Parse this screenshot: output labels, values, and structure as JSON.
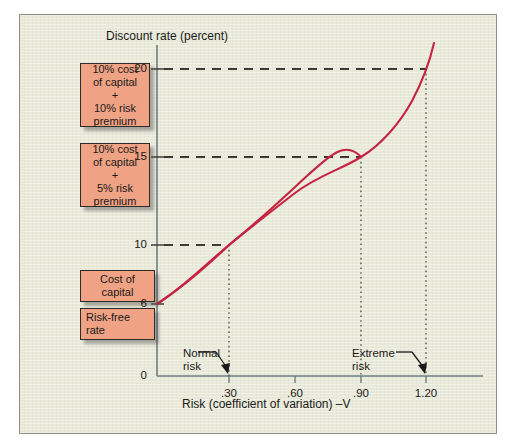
{
  "chart_data": {
    "type": "line",
    "title": "Discount rate (percent)",
    "xlabel": "Risk (coefficient of variation) –V",
    "ylabel": "Discount rate (percent)",
    "xlim": [
      0,
      1.35
    ],
    "ylim": [
      0,
      22.5
    ],
    "grid": false,
    "legend_position": "left-outside",
    "xticks": [
      ".30",
      ".60",
      ".90",
      "1.20"
    ],
    "xtick_values": [
      0.3,
      0.6,
      0.9,
      1.2
    ],
    "yticks": [
      "0",
      "6",
      "10",
      "15",
      "20"
    ],
    "ytick_values": [
      0,
      6,
      10,
      15,
      20
    ],
    "series": [
      {
        "name": "Risk-return tradeoff curve",
        "color": "#c62340",
        "x": [
          0.0,
          0.15,
          0.3,
          0.45,
          0.6,
          0.75,
          0.9,
          1.05,
          1.2,
          1.32
        ],
        "y": [
          6.0,
          7.9,
          10.0,
          11.2,
          12.3,
          13.5,
          15.0,
          17.1,
          20.0,
          22.3
        ]
      }
    ],
    "reference_points": [
      {
        "label": "Cost of capital",
        "x": 0.3,
        "y": 10
      },
      {
        "label": "10% cost of capital + 5% risk premium",
        "x": 0.9,
        "y": 15
      },
      {
        "label": "10% cost of capital + 10% risk premium",
        "x": 1.2,
        "y": 20
      }
    ],
    "dashed_guides": [
      {
        "y": 20,
        "x_to": 1.2
      },
      {
        "y": 15,
        "x_to": 0.9
      },
      {
        "y": 10,
        "x_to": 0.3
      }
    ],
    "dotted_drops": [
      0.3,
      0.9,
      1.2
    ],
    "annotations": [
      {
        "text": "Normal risk",
        "points_to_x": 0.3,
        "points_to_y": 0
      },
      {
        "text": "Extreme risk",
        "points_to_x": 1.2,
        "points_to_y": 0
      }
    ],
    "background_color": "#e9e9d9",
    "curve_color": "#c62340",
    "box_color": "#efa384"
  },
  "axis": {
    "y_title": "Discount rate (percent)",
    "x_title": "Risk (coefficient of variation) –V",
    "y_ticks": [
      {
        "label": "20"
      },
      {
        "label": "15"
      },
      {
        "label": "10"
      },
      {
        "label": "6"
      },
      {
        "label": "0"
      }
    ],
    "x_ticks": [
      {
        "label": ".30"
      },
      {
        "label": ".60"
      },
      {
        "label": ".90"
      },
      {
        "label": "1.20"
      }
    ]
  },
  "callout_boxes": [
    {
      "lines": [
        "10% cost",
        "of capital",
        "+",
        "10% risk",
        "premium"
      ],
      "text": "10% cost\nof capital\n+\n10% risk\npremium"
    },
    {
      "lines": [
        "10% cost",
        "of capital",
        "+",
        "5% risk",
        "premium"
      ],
      "text": "10% cost\nof capital\n+\n5% risk\npremium"
    },
    {
      "lines": [
        "Cost of",
        "capital"
      ],
      "text": "Cost of\ncapital"
    },
    {
      "lines": [
        "Risk-free",
        "rate"
      ],
      "text": "Risk-free\nrate"
    }
  ],
  "annotations": {
    "normal_risk": "Normal\nrisk",
    "extreme_risk": "Extreme\nrisk"
  }
}
